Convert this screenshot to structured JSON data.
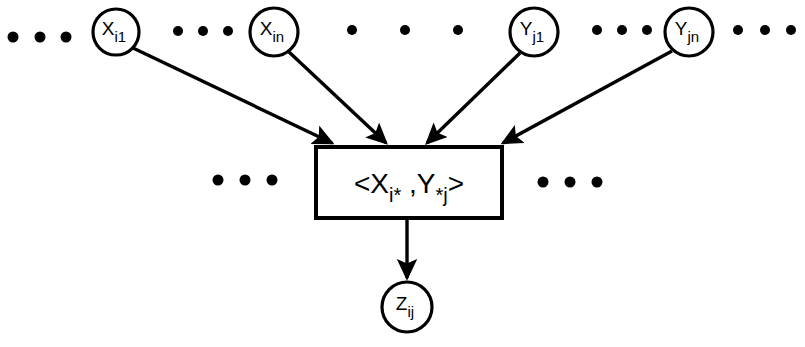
{
  "diagram": {
    "background_color": "#ffffff",
    "stroke_color": "#000000",
    "nodes": [
      {
        "id": "x_i1",
        "base": "X",
        "sub": "i1",
        "cx": 116,
        "cy": 32,
        "r": 23
      },
      {
        "id": "x_in",
        "base": "X",
        "sub": "in",
        "cx": 274,
        "cy": 32,
        "r": 24
      },
      {
        "id": "y_j1",
        "base": "Y",
        "sub": "j1",
        "cx": 534,
        "cy": 32,
        "r": 24
      },
      {
        "id": "y_jn",
        "base": "Y",
        "sub": "jn",
        "cx": 689,
        "cy": 32,
        "r": 24
      },
      {
        "id": "z_ij",
        "base": "Z",
        "sub": "ij",
        "cx": 407,
        "cy": 307,
        "r": 25
      }
    ],
    "box": {
      "id": "pair-box",
      "x": 316,
      "y": 147,
      "width": 186,
      "height": 71,
      "label_open": "<X",
      "label_sub_left": "i*",
      "label_comma": " ,Y",
      "label_sub_right": "*j",
      "label_close": ">"
    },
    "edges": [
      {
        "id": "edge-x-i1-to-box",
        "from": "x_i1",
        "to": "pair-box",
        "x1": 133,
        "y1": 48,
        "x2": 332,
        "y2": 143
      },
      {
        "id": "edge-x-in-to-box",
        "from": "x_in",
        "to": "pair-box",
        "x1": 289,
        "y1": 52,
        "x2": 386,
        "y2": 143
      },
      {
        "id": "edge-y-j1-to-box",
        "from": "y_j1",
        "to": "pair-box",
        "x1": 520,
        "y1": 53,
        "x2": 427,
        "y2": 143
      },
      {
        "id": "edge-y-jn-to-box",
        "from": "y_jn",
        "to": "pair-box",
        "x1": 672,
        "y1": 51,
        "x2": 503,
        "y2": 143
      },
      {
        "id": "edge-box-to-z",
        "from": "pair-box",
        "to": "z_ij",
        "x1": 407,
        "y1": 218,
        "x2": 407,
        "y2": 278
      }
    ],
    "ellipses": [
      {
        "id": "ellipsis-far-left",
        "cy": 37,
        "r": 5.5,
        "dots_x": [
          13,
          40,
          66
        ]
      },
      {
        "id": "ellipsis-between-x",
        "cy": 31,
        "r": 5.0,
        "dots_x": [
          178,
          203,
          228
        ]
      },
      {
        "id": "ellipsis-between-x-y",
        "cy": 30,
        "r": 5.0,
        "dots_x": [
          352,
          405,
          458
        ]
      },
      {
        "id": "ellipsis-between-y",
        "cy": 30,
        "r": 5.0,
        "dots_x": [
          597,
          622,
          647
        ]
      },
      {
        "id": "ellipsis-far-right",
        "cy": 30,
        "r": 5.0,
        "dots_x": [
          738,
          765,
          791
        ]
      },
      {
        "id": "ellipsis-box-left",
        "cy": 180,
        "r": 5.5,
        "dots_x": [
          218,
          245,
          272
        ]
      },
      {
        "id": "ellipsis-box-right",
        "cy": 182,
        "r": 5.5,
        "dots_x": [
          543,
          570,
          597
        ]
      }
    ]
  }
}
